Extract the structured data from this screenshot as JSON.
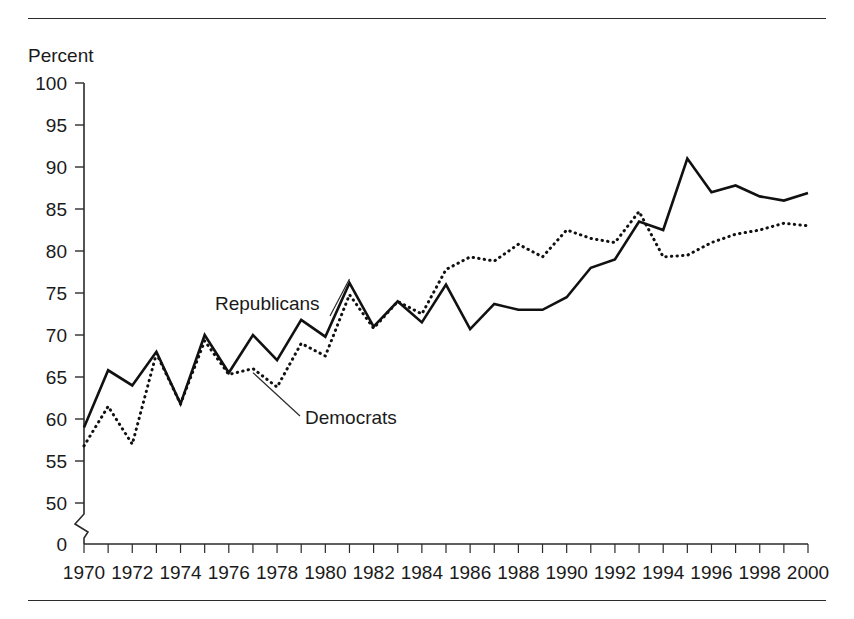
{
  "chart_data": {
    "type": "line",
    "title": "",
    "xlabel": "",
    "ylabel": "Percent",
    "ylim": [
      50,
      100
    ],
    "y_axis_break": true,
    "y_zero_tick": "0",
    "yticks": [
      50,
      55,
      60,
      65,
      70,
      75,
      80,
      85,
      90,
      95,
      100
    ],
    "ytick_labels": [
      "0",
      "50",
      "55",
      "60",
      "65",
      "70",
      "75",
      "80",
      "85",
      "90",
      "95",
      "100"
    ],
    "xlim": [
      1970,
      2000
    ],
    "x": [
      1970,
      1971,
      1972,
      1973,
      1974,
      1975,
      1976,
      1977,
      1978,
      1979,
      1980,
      1981,
      1982,
      1983,
      1984,
      1985,
      1986,
      1987,
      1988,
      1989,
      1990,
      1991,
      1992,
      1993,
      1994,
      1995,
      1996,
      1997,
      1998,
      1999,
      2000
    ],
    "xtick_labels": [
      "1970",
      "1972",
      "1974",
      "1976",
      "1978",
      "1980",
      "1982",
      "1984",
      "1986",
      "1988",
      "1990",
      "1992",
      "1994",
      "1996",
      "1998",
      "2000"
    ],
    "xtick_label_step": 2,
    "xtick_minor_step": 1,
    "grid": false,
    "legend_position": "inline-annotations",
    "series": [
      {
        "name": "Republicans",
        "style": "solid",
        "color": "#111111",
        "values": [
          59.0,
          65.8,
          64.0,
          68.0,
          61.8,
          70.0,
          65.5,
          70.0,
          67.0,
          71.8,
          69.8,
          76.2,
          71.0,
          74.0,
          71.5,
          76.0,
          70.7,
          73.7,
          73.0,
          73.0,
          74.5,
          78.0,
          79.0,
          83.5,
          82.5,
          91.0,
          87.0,
          87.8,
          86.5,
          86.0,
          86.9
        ]
      },
      {
        "name": "Democrats",
        "style": "dotted",
        "color": "#111111",
        "values": [
          56.8,
          61.5,
          57.0,
          67.8,
          61.8,
          69.3,
          65.3,
          66.0,
          63.8,
          69.0,
          67.5,
          74.8,
          70.8,
          74.0,
          72.5,
          77.8,
          79.3,
          78.8,
          80.8,
          79.3,
          82.5,
          81.5,
          81.0,
          84.7,
          79.3,
          79.5,
          81.0,
          82.0,
          82.5,
          83.3,
          83.0
        ]
      }
    ],
    "annotations": [
      {
        "text": "Republicans",
        "target_series": "Republicans",
        "target_x": 1981
      },
      {
        "text": "Democrats",
        "target_series": "Democrats",
        "target_x": 1977
      }
    ]
  }
}
